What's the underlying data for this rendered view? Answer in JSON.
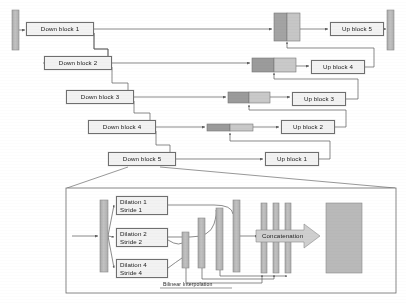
{
  "figure": {
    "type": "architecture-diagram",
    "background": "#ffffff",
    "line_color": "#585858",
    "box_fill": "#f2f2f2",
    "box_stroke": "#6f6f6f",
    "bar_fill": "#b5b5b5",
    "bar_stroke": "#8a8a8a",
    "concat_dark_fill": "#9a9a9a",
    "concat_light_fill": "#c8c8c8"
  },
  "encoder": {
    "label": "Down blocks",
    "blocks": [
      {
        "id": "down-block-1",
        "label": "Down block 1",
        "x": 26,
        "y": 22,
        "w": 68,
        "h": 14
      },
      {
        "id": "down-block-2",
        "label": "Down block 2",
        "x": 44,
        "y": 56,
        "w": 68,
        "h": 14
      },
      {
        "id": "down-block-3",
        "label": "Down block 3",
        "x": 66,
        "y": 90,
        "w": 68,
        "h": 14
      },
      {
        "id": "down-block-4",
        "label": "Down block 4",
        "x": 88,
        "y": 120,
        "w": 68,
        "h": 14
      },
      {
        "id": "down-block-5",
        "label": "Down block 5",
        "x": 108,
        "y": 152,
        "w": 68,
        "h": 14
      }
    ]
  },
  "decoder": {
    "label": "Up blocks",
    "blocks": [
      {
        "id": "up-block-5",
        "label": "Up block 5",
        "x": 330,
        "y": 22,
        "w": 54,
        "h": 14
      },
      {
        "id": "up-block-4",
        "label": "Up block 4",
        "x": 311,
        "y": 60,
        "w": 54,
        "h": 14
      },
      {
        "id": "up-block-3",
        "label": "Up block 3",
        "x": 292,
        "y": 92,
        "w": 54,
        "h": 14
      },
      {
        "id": "up-block-2",
        "label": "Up block 2",
        "x": 281,
        "y": 120,
        "w": 54,
        "h": 14
      },
      {
        "id": "up-block-1",
        "label": "Up block 1",
        "x": 265,
        "y": 152,
        "w": 54,
        "h": 14
      }
    ]
  },
  "endpoints": {
    "input_bar": {
      "id": "input-feature-bar",
      "x": 12,
      "y": 10,
      "w": 7,
      "h": 40
    },
    "output_bar": {
      "id": "output-feature-bar",
      "x": 387,
      "y": 10,
      "w": 7,
      "h": 40
    }
  },
  "skip_fusions": [
    {
      "id": "fusion-1",
      "x": 274,
      "y": 13,
      "w": 26,
      "h": 28
    },
    {
      "id": "fusion-2",
      "x": 252,
      "y": 58,
      "w": 44,
      "h": 14
    },
    {
      "id": "fusion-3",
      "x": 228,
      "y": 92,
      "w": 42,
      "h": 11
    },
    {
      "id": "fusion-4",
      "x": 207,
      "y": 124,
      "w": 46,
      "h": 7
    }
  ],
  "detail_panel": {
    "id": "dilated-block-detail",
    "x": 66,
    "y": 188,
    "w": 330,
    "h": 105,
    "callout_from": {
      "x": 142,
      "y": 166
    },
    "branches": [
      {
        "id": "branch-dilation-1",
        "line1": "Dilation 1",
        "line2": "Stride 1",
        "x": 116,
        "y": 196,
        "w": 52,
        "h": 19
      },
      {
        "id": "branch-dilation-2",
        "line1": "Dilation 2",
        "line2": "Stride 2",
        "x": 116,
        "y": 228,
        "w": 52,
        "h": 19
      },
      {
        "id": "branch-dilation-3",
        "line1": "Dilation 4",
        "line2": "Stride 4",
        "x": 116,
        "y": 259,
        "w": 52,
        "h": 19
      },
      {
        "id": "branch-dilation-4",
        "line1": "Dilation 8",
        "line2": "Stride 8",
        "x": 0,
        "y": 0,
        "w": 0,
        "h": 0
      }
    ],
    "concatenation_label": "Concatenation",
    "interpolation_label": "Bilinear Interpolation",
    "input_bar": {
      "x": 100,
      "y": 200,
      "w": 8,
      "h": 72
    },
    "feature_bars": [
      {
        "x": 182,
        "y": 232,
        "w": 7,
        "h": 36
      },
      {
        "x": 198,
        "y": 218,
        "w": 7,
        "h": 50
      },
      {
        "x": 216,
        "y": 208,
        "w": 7,
        "h": 62
      },
      {
        "x": 233,
        "y": 200,
        "w": 7,
        "h": 72
      }
    ],
    "output_bars": [
      {
        "x": 261,
        "y": 203,
        "w": 6,
        "h": 70
      },
      {
        "x": 273,
        "y": 203,
        "w": 6,
        "h": 70
      },
      {
        "x": 285,
        "y": 203,
        "w": 6,
        "h": 70
      }
    ],
    "final_block": {
      "x": 326,
      "y": 203,
      "w": 36,
      "h": 70
    }
  }
}
